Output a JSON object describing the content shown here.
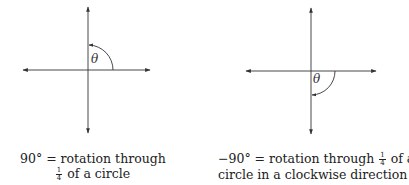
{
  "figures": [
    {
      "id": "positive-90",
      "angle_label": "θ",
      "direction": "counterclockwise",
      "caption": {
        "line1_lead": "90° = rotation through",
        "line2_frac_num": "1",
        "line2_frac_den": "4",
        "line2_rest": "of a circle"
      }
    },
    {
      "id": "negative-90",
      "angle_label": "θ",
      "direction": "clockwise",
      "caption": {
        "line1_lead": "−90° = rotation through",
        "line1_frac_num": "1",
        "line1_frac_den": "4",
        "line1_rest": "of a",
        "line2": "circle in a clockwise direction"
      }
    }
  ],
  "colors": {
    "line": "#333333",
    "text": "#222222",
    "background": "#ffffff"
  }
}
